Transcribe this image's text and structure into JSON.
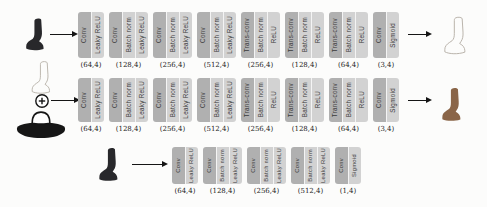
{
  "colors": {
    "background": "#fcfcfb",
    "layer_primary": "#b0b0b0",
    "layer_secondary": "#d2d2d2",
    "layer_text": "#3a3a3a",
    "dim_label_text": "#1d1d1d",
    "arrow": "#151515",
    "photo_dark": "#28282b",
    "sketch_stroke": "#b3ada4",
    "output_boot_brown": "#8a6548",
    "hat_black": "#161616"
  },
  "icons": {
    "combine": "circle-plus-icon",
    "flow": "right-arrow-icon"
  },
  "rows": [
    {
      "id": "top",
      "input_image": "dark-ankle-boot-photo",
      "output_image": "ankle-boot-sketch",
      "blocks": [
        {
          "layers": [
            "Conv",
            "Leaky ReLU"
          ],
          "label": "(64,4)"
        },
        {
          "layers": [
            "Conv",
            "Batch norm",
            "Leaky ReLU"
          ],
          "label": "(128,4)"
        },
        {
          "layers": [
            "Conv",
            "Batch norm",
            "Leaky ReLU"
          ],
          "label": "(256,4)"
        },
        {
          "layers": [
            "Conv",
            "Batch norm",
            "Leaky ReLU"
          ],
          "label": "(512,4)"
        },
        {
          "layers": [
            "Trans-conv",
            "Batch norm",
            "ReLU"
          ],
          "label": "(256,4)"
        },
        {
          "layers": [
            "Trans-conv",
            "Batch norm",
            "ReLU"
          ],
          "label": "(128,4)"
        },
        {
          "layers": [
            "Trans-conv",
            "Batch norm",
            "ReLU"
          ],
          "label": "(64,4)"
        },
        {
          "layers": [
            "Conv",
            "Sigmoid"
          ],
          "label": "(3,4)"
        }
      ]
    },
    {
      "id": "middle",
      "input_images": [
        "ankle-boot-sketch",
        "circle-plus",
        "dark-hat-photo"
      ],
      "output_image": "brown-ankle-boot-photo",
      "blocks": [
        {
          "layers": [
            "Conv",
            "Leaky ReLU"
          ],
          "label": "(64,4)"
        },
        {
          "layers": [
            "Conv",
            "Batch norm",
            "Leaky ReLU"
          ],
          "label": "(128,4)"
        },
        {
          "layers": [
            "Conv",
            "Batch norm",
            "Leaky ReLU"
          ],
          "label": "(256,4)"
        },
        {
          "layers": [
            "Conv",
            "Batch norm",
            "Leaky ReLU"
          ],
          "label": "(512,4)"
        },
        {
          "layers": [
            "Trans-conv",
            "Batch norm",
            "ReLU"
          ],
          "label": "(256,4)"
        },
        {
          "layers": [
            "Trans-conv",
            "Batch norm",
            "ReLU"
          ],
          "label": "(128,4)"
        },
        {
          "layers": [
            "Trans-conv",
            "Batch norm",
            "ReLU"
          ],
          "label": "(64,4)"
        },
        {
          "layers": [
            "Conv",
            "Sigmoid"
          ],
          "label": "(3,4)"
        }
      ]
    },
    {
      "id": "bottom",
      "input_image": "dark-ankle-boot-photo",
      "blocks": [
        {
          "layers": [
            "Conv",
            "Leaky ReLU"
          ],
          "label": "(64,4)"
        },
        {
          "layers": [
            "Conv",
            "Batch norm",
            "Leaky ReLU"
          ],
          "label": "(128,4)"
        },
        {
          "layers": [
            "Conv",
            "Batch norm",
            "Leaky ReLU"
          ],
          "label": "(256,4)"
        },
        {
          "layers": [
            "Conv",
            "Batch norm",
            "Leaky ReLU"
          ],
          "label": "(512,4)"
        },
        {
          "layers": [
            "Conv",
            "Sigmoid"
          ],
          "label": "(1,4)"
        }
      ]
    }
  ]
}
